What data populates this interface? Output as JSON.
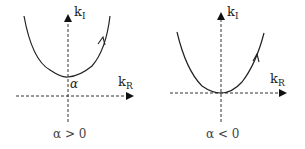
{
  "panels": [
    {
      "y_axis": {
        "name": "k",
        "sub": "I"
      },
      "x_axis": {
        "name": "k",
        "sub": "R"
      },
      "vertex_label": "α",
      "caption": "α > 0"
    },
    {
      "y_axis": {
        "name": "k",
        "sub": "I"
      },
      "x_axis": {
        "name": "k",
        "sub": "R"
      },
      "caption": "α < 0"
    }
  ]
}
